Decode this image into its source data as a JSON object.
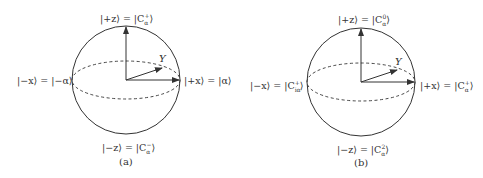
{
  "figure": {
    "panels": [
      {
        "caption": "(a)",
        "labels": {
          "top": "|+z⟩ = |Cₐ⁺⟩",
          "top_text": "|+z⟩ = |C",
          "top_sup": "+",
          "top_sub": "α",
          "bottom_text": "|−z⟩ = |C",
          "bottom_sup": "−",
          "bottom_sub": "α",
          "left": "|−x⟩ = |−α⟩",
          "right": "|+x⟩ = |α⟩",
          "y_axis": "Y"
        }
      },
      {
        "caption": "(b)",
        "labels": {
          "top_text": "|+z⟩ = |C",
          "top_sup": "0",
          "top_sub": "α",
          "bottom_text": "|−z⟩ = |C",
          "bottom_sup": "2",
          "bottom_sub": "α",
          "left_text": "|−x⟩ = |C",
          "left_sup": "+",
          "left_sub": "iα",
          "right_text": "|+x⟩ = |C",
          "right_sup": "+",
          "right_sub": "α",
          "y_axis": "Y"
        }
      }
    ],
    "colors": {
      "stroke": "#333333",
      "text": "#333333",
      "background": "#ffffff"
    }
  }
}
